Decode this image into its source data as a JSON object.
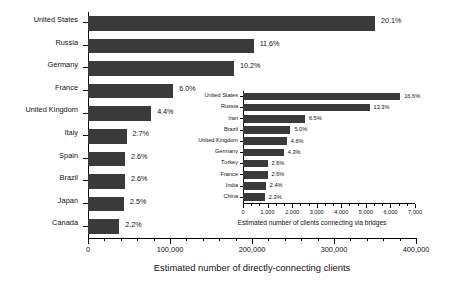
{
  "chart_data": [
    {
      "id": "main",
      "type": "bar",
      "orientation": "horizontal",
      "title": "",
      "xlabel": "Estimated number of directly-connecting clients",
      "ylabel": "",
      "xlim": [
        0,
        400000
      ],
      "xticks": [
        0,
        100000,
        200000,
        300000,
        400000
      ],
      "xticklabels": [
        "0",
        "100,000",
        "200,000",
        "300,000",
        "400,000"
      ],
      "minor_ticks_per_interval": 4,
      "grid": false,
      "legend": false,
      "bar_color": "#3a3a3a",
      "categories": [
        "United States",
        "Russia",
        "Germany",
        "France",
        "United Kingdom",
        "Italy",
        "Spain",
        "Brazil",
        "Japan",
        "Canada"
      ],
      "values": [
        350000,
        202000,
        178000,
        104000,
        77000,
        47000,
        45000,
        45000,
        44000,
        38000
      ],
      "data_labels": [
        "20.1%",
        "11.6%",
        "10.2%",
        "6.0%",
        "4.4%",
        "2.7%",
        "2.6%",
        "2.6%",
        "2.5%",
        "2.2%"
      ],
      "percentages": [
        20.1,
        11.6,
        10.2,
        6.0,
        4.4,
        2.7,
        2.6,
        2.6,
        2.5,
        2.2
      ]
    },
    {
      "id": "inset",
      "type": "bar",
      "orientation": "horizontal",
      "title": "",
      "xlabel": "Estimated number of clients connecting via bridges",
      "ylabel": "",
      "xlim": [
        0,
        7000
      ],
      "xticks": [
        0,
        1000,
        2000,
        3000,
        4000,
        5000,
        6000,
        7000
      ],
      "xticklabels": [
        "0",
        "1,000",
        "2,000",
        "3,000",
        "4,000",
        "5,000",
        "6,000",
        "7,000"
      ],
      "minor_ticks_per_interval": 2,
      "grid": false,
      "legend": false,
      "bar_color": "#3a3a3a",
      "categories": [
        "United States",
        "Russia",
        "Iran",
        "Brazil",
        "United Kingdom",
        "Germany",
        "Turkey",
        "France",
        "India",
        "China"
      ],
      "values": [
        6400,
        5150,
        2520,
        1930,
        1780,
        1660,
        1000,
        1000,
        930,
        890
      ],
      "data_labels": [
        "16.6%",
        "13.3%",
        "6.5%",
        "5.0%",
        "4.6%",
        "4.3%",
        "2.6%",
        "2.6%",
        "2.4%",
        "2.3%"
      ],
      "percentages": [
        16.6,
        13.3,
        6.5,
        5.0,
        4.6,
        4.3,
        2.6,
        2.6,
        2.4,
        2.3
      ]
    }
  ]
}
